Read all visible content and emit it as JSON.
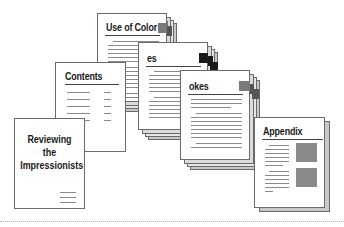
{
  "diagram": {
    "type": "document-structure",
    "pages": [
      {
        "id": "cover",
        "title_lines": [
          "Reviewing",
          "the",
          "Impressionists"
        ]
      },
      {
        "id": "contents",
        "title": "Contents"
      },
      {
        "id": "use-of-color",
        "title": "Use of Color"
      },
      {
        "id": "chapter-es",
        "title": "es"
      },
      {
        "id": "chapter-okes",
        "title": "okes"
      },
      {
        "id": "appendix",
        "title": "Appendix"
      }
    ],
    "colors": {
      "page_bg": "#ffffff",
      "page_border": "#6a6a6a",
      "shadow": "#c8c8c8",
      "text_line": "#8a8a8a",
      "tab_grey": "#7a7a7a",
      "tab_black": "#1a1a1a",
      "image_block": "#8a8a8a"
    }
  }
}
